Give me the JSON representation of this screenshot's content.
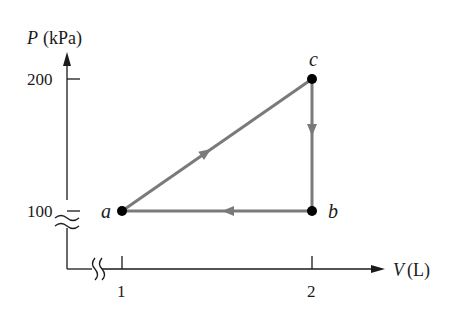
{
  "diagram": {
    "type": "pv-cycle",
    "y_axis": {
      "symbol": "P",
      "unit": "(kPa)",
      "ticks": [
        {
          "label": "200",
          "value": 200
        },
        {
          "label": "100",
          "value": 100
        }
      ],
      "break": true
    },
    "x_axis": {
      "symbol": "V",
      "unit": "(L)",
      "ticks": [
        {
          "label": "1",
          "value": 1
        },
        {
          "label": "2",
          "value": 2
        }
      ],
      "break": true
    },
    "points": [
      {
        "label": "a",
        "V": 1,
        "P": 100
      },
      {
        "label": "b",
        "V": 2,
        "P": 100
      },
      {
        "label": "c",
        "V": 2,
        "P": 200
      }
    ],
    "paths": [
      {
        "from": "a",
        "to": "c",
        "direction": "a→c"
      },
      {
        "from": "c",
        "to": "b",
        "direction": "c→b"
      },
      {
        "from": "b",
        "to": "a",
        "direction": "b→a"
      }
    ],
    "colors": {
      "path": "#7a7a7a",
      "axis": "#1a1a1a",
      "point": "#000000"
    }
  }
}
